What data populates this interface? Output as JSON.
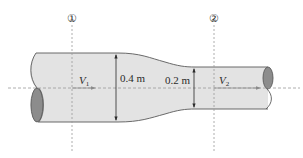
{
  "diagram": {
    "type": "converging-pipe-flow",
    "sections": [
      {
        "marker": "①",
        "velocity_label": "V",
        "velocity_sub": "1",
        "diameter_label": "0.4 m"
      },
      {
        "marker": "②",
        "velocity_label": "V",
        "velocity_sub": "2",
        "diameter_label": "0.2 m"
      }
    ],
    "colors": {
      "pipe_fill": "#e3e3e3",
      "pipe_outline": "#5a5a5a",
      "pipe_end_fill": "#8c8c8c",
      "dashed_line": "#9a9a9a",
      "text": "#2a2a2a"
    }
  }
}
